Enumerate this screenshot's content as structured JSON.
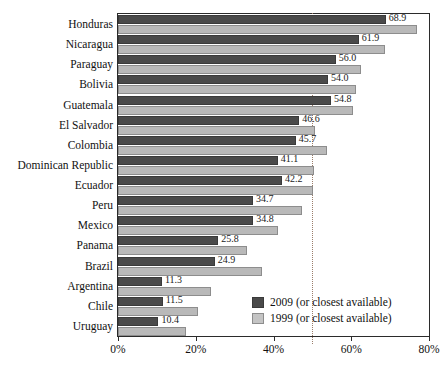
{
  "chart_data": {
    "type": "bar",
    "orientation": "horizontal",
    "title": "",
    "subtitle": "",
    "xlabel": "",
    "ylabel": "",
    "xlim": [
      0,
      80
    ],
    "xticks": [
      0,
      20,
      40,
      60,
      80
    ],
    "xtick_labels": [
      "0%",
      "20%",
      "40%",
      "60%",
      "80%"
    ],
    "grid": false,
    "reference_line": {
      "value": 50,
      "style": "dotted",
      "color": "#9a7d6a"
    },
    "legend_position": "inside-bottom-right",
    "colors": {
      "series_2009": "#4a4a4a",
      "series_1999": "#b9b9b9",
      "frame": "#2b2b2b",
      "text": "#111111"
    },
    "categories": [
      "Honduras",
      "Nicaragua",
      "Paraguay",
      "Bolivia",
      "Guatemala",
      "El Salvador",
      "Colombia",
      "Dominican Republic",
      "Ecuador",
      "Peru",
      "Mexico",
      "Panama",
      "Brazil",
      "Argentina",
      "Chile",
      "Uruguay"
    ],
    "series": [
      {
        "name": "2009 (or closest available)",
        "color": "#4a4a4a",
        "labelled": true,
        "values": [
          68.9,
          61.9,
          56.0,
          54.0,
          54.8,
          46.6,
          45.7,
          41.1,
          42.2,
          34.7,
          34.8,
          25.8,
          24.9,
          11.3,
          11.5,
          10.4
        ],
        "value_labels": [
          "68.9",
          "61.9",
          "56.0",
          "54.0",
          "54.8",
          "46.6",
          "45.7",
          "41.1",
          "42.2",
          "34.7",
          "34.8",
          "25.8",
          "24.9",
          "11.3",
          "11.5",
          "10.4"
        ]
      },
      {
        "name": "1999 (or closest available)",
        "color": "#b9b9b9",
        "labelled": false,
        "values": [
          76.8,
          68.6,
          62.4,
          61.2,
          60.4,
          50.6,
          53.7,
          50.3,
          50.1,
          47.3,
          41.2,
          33.2,
          37.1,
          23.8,
          20.7,
          17.4
        ],
        "value_labels": []
      }
    ]
  },
  "legend": {
    "items": [
      {
        "label": "2009 (or closest available)",
        "swatch": "cur"
      },
      {
        "label": "1999 (or closest available)",
        "swatch": "prev"
      }
    ]
  }
}
